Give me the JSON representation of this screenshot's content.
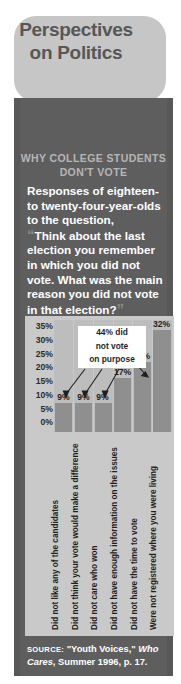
{
  "title": {
    "line1": "Perspectives",
    "line2": "on Politics"
  },
  "kicker": {
    "line1": "WHY COLLEGE STUDENTS",
    "line2": "DON'T VOTE"
  },
  "lead": {
    "intro": "Responses of eighteen- to twenty-four-year-olds to the question,",
    "quote_open": "“",
    "quote": "Think about the last election you remember in which you did not vote. What was the main reason you did not vote in that election?",
    "quote_close": "”"
  },
  "callout": {
    "line1": "44% did",
    "line2": "not vote",
    "line3": "on purpose"
  },
  "source": {
    "label": "SOURCE:",
    "pre": " \"Youth Voices,\" ",
    "italic": "Who Cares",
    "post": ", Summer 1996, p. 17."
  },
  "colors": {
    "panel": "#5e5e5e",
    "panel_edge": "#585858",
    "bubble": "#c6c6c6",
    "bubble_text": "#575757",
    "chart_bg": "#c9c9c9",
    "plot_bg": "#bdbdbd",
    "bar": "#8f8f8f",
    "kicker": "#b6b6b6",
    "body_text": "#ffffff"
  },
  "chart_data": {
    "type": "bar",
    "title": "WHY COLLEGE STUDENTS DON'T VOTE",
    "xlabel": "",
    "ylabel": "",
    "ylim": [
      0,
      35
    ],
    "grid": false,
    "legend": "none",
    "ticks": [
      "35%",
      "30%",
      "25%",
      "20%",
      "15%",
      "10%",
      "5%",
      "0%"
    ],
    "tick_values": [
      35,
      30,
      25,
      20,
      15,
      10,
      5,
      0
    ],
    "categories": [
      "Did not like any of the candidates",
      "Did not think your vote would make a difference",
      "Did not care who won",
      "Did not have enough information on the issues",
      "Did not have the time to vote",
      "Were not registered where you were living"
    ],
    "values": [
      9,
      9,
      9,
      17,
      22,
      32
    ],
    "value_labels": [
      "9%",
      "9%",
      "9%",
      "17%",
      "22%",
      "32%"
    ],
    "annotation": "44% did not vote on purpose",
    "annotation_targets": [
      0,
      1,
      2
    ]
  }
}
